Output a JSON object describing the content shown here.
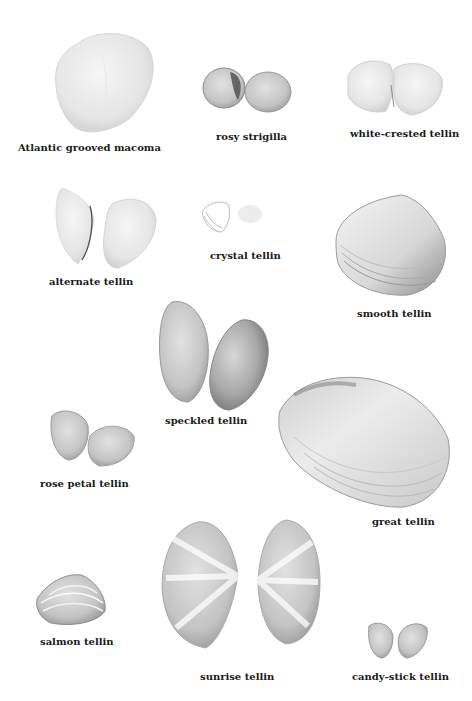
{
  "plate": {
    "title": "Tellins and relatives",
    "shells": [
      {
        "id": "atlantic-grooved-macoma",
        "label": "Atlantic grooved macoma"
      },
      {
        "id": "rosy-strigilla",
        "label": "rosy strigilla"
      },
      {
        "id": "white-crested-tellin",
        "label": "white-crested tellin"
      },
      {
        "id": "alternate-tellin",
        "label": "alternate tellin"
      },
      {
        "id": "crystal-tellin",
        "label": "crystal tellin"
      },
      {
        "id": "smooth-tellin",
        "label": "smooth tellin"
      },
      {
        "id": "speckled-tellin",
        "label": "speckled tellin"
      },
      {
        "id": "rose-petal-tellin",
        "label": "rose petal tellin"
      },
      {
        "id": "great-tellin",
        "label": "great tellin"
      },
      {
        "id": "salmon-tellin",
        "label": "salmon tellin"
      },
      {
        "id": "sunrise-tellin",
        "label": "sunrise tellin"
      },
      {
        "id": "candy-stick-tellin",
        "label": "candy-stick tellin"
      }
    ]
  },
  "colors": {
    "background": "#ffffff",
    "label_text": "#1a1a1a",
    "shell_light": "#eeeeee",
    "shell_mid": "#c8c8c8",
    "shell_dark": "#7a7a7a"
  }
}
